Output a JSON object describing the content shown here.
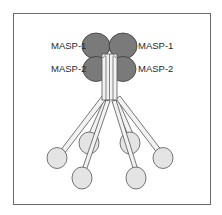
{
  "diagram": {
    "labels": {
      "left_top": "MASP-1",
      "right_top": "MASP-1",
      "left_bottom": "MASP-2",
      "right_bottom": "MASP-2"
    },
    "colors": {
      "masp_fill": "#7a7a7a",
      "masp_stroke": "#3a3a3a",
      "head_fill": "#e4e4e4",
      "stalk_fill": "#f2f2f2",
      "line": "#555555",
      "frame": "#6a6a6a"
    }
  }
}
